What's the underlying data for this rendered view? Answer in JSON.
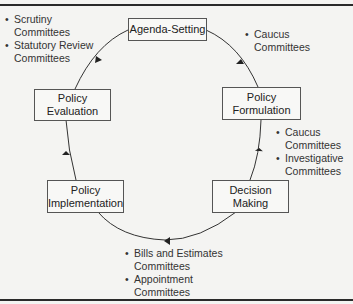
{
  "diagram": {
    "type": "cycle",
    "stages": [
      {
        "id": "agenda",
        "label_lines": [
          "Agenda-Setting"
        ]
      },
      {
        "id": "formulation",
        "label_lines": [
          "Policy",
          "Formulation"
        ]
      },
      {
        "id": "decision",
        "label_lines": [
          "Decision",
          "Making"
        ]
      },
      {
        "id": "implementation",
        "label_lines": [
          "Policy",
          "Implementation"
        ]
      },
      {
        "id": "evaluation",
        "label_lines": [
          "Policy",
          "Evaluation"
        ]
      }
    ],
    "annotations": {
      "top_left": [
        "Scrutiny Committees",
        "Statutory Review Committees"
      ],
      "top_right": [
        "Caucus Committees"
      ],
      "right": [
        "Caucus Committees",
        "Investigative Committees"
      ],
      "bottom": [
        "Bills and Estimates Committees",
        "Appointment Committees"
      ]
    },
    "annotation_lines": {
      "top_left": [
        [
          "Scrutiny",
          "Committees"
        ],
        [
          "Statutory Review",
          "Committees"
        ]
      ],
      "top_right": [
        [
          "Caucus",
          "Committees"
        ]
      ],
      "right": [
        [
          "Caucus",
          "Committees"
        ],
        [
          "Investigative",
          "Committees"
        ]
      ],
      "bottom": [
        [
          "Bills and Estimates",
          "Committees"
        ],
        [
          "Appointment",
          "Committees"
        ]
      ]
    },
    "flow_direction": "clockwise",
    "colors": {
      "line": "#333333",
      "box_border": "#555555",
      "background": "#f4f4f2"
    }
  }
}
